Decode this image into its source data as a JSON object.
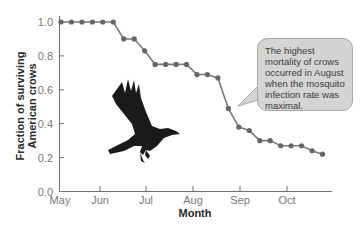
{
  "chart_data": {
    "type": "line",
    "title": "",
    "xlabel": "Month",
    "ylabel": "Fraction of surviving American crows",
    "ylabel_lines": [
      "Fraction of surviving",
      "American crows"
    ],
    "ylim": [
      0.0,
      1.0
    ],
    "yticks": [
      "0.0",
      "0.2",
      "0.4",
      "0.6",
      "0.8",
      "1.0"
    ],
    "xticks": [
      "May",
      "Jun",
      "Jul",
      "Aug",
      "Sep",
      "Oct"
    ],
    "grid": false,
    "legend": null,
    "series": [
      {
        "name": "Fraction of surviving American crows",
        "color": "#7a7a7a",
        "marker_color": "#666666",
        "points": [
          {
            "x": "May wk1",
            "y": 1.0
          },
          {
            "x": "May wk2",
            "y": 1.0
          },
          {
            "x": "May wk3",
            "y": 1.0
          },
          {
            "x": "May wk4",
            "y": 1.0
          },
          {
            "x": "Jun wk1",
            "y": 1.0
          },
          {
            "x": "Jun wk2",
            "y": 1.0
          },
          {
            "x": "Jun wk3",
            "y": 0.9
          },
          {
            "x": "Jun wk4",
            "y": 0.9
          },
          {
            "x": "Jul wk1",
            "y": 0.83
          },
          {
            "x": "Jul wk2",
            "y": 0.75
          },
          {
            "x": "Jul wk3",
            "y": 0.75
          },
          {
            "x": "Jul wk4",
            "y": 0.75
          },
          {
            "x": "Aug wk1",
            "y": 0.75
          },
          {
            "x": "Aug wk2",
            "y": 0.69
          },
          {
            "x": "Aug wk3",
            "y": 0.69
          },
          {
            "x": "Aug wk4",
            "y": 0.67
          },
          {
            "x": "Sep wk1",
            "y": 0.49
          },
          {
            "x": "Sep wk2",
            "y": 0.38
          },
          {
            "x": "Sep wk3",
            "y": 0.36
          },
          {
            "x": "Sep wk4",
            "y": 0.3
          },
          {
            "x": "Oct wk1",
            "y": 0.3
          },
          {
            "x": "Oct wk2",
            "y": 0.27
          },
          {
            "x": "Oct wk3",
            "y": 0.27
          },
          {
            "x": "Oct wk4",
            "y": 0.27
          },
          {
            "x": "Nov wk1",
            "y": 0.24
          },
          {
            "x": "Nov wk2",
            "y": 0.22
          }
        ]
      }
    ],
    "annotations": [
      {
        "text": "The highest mortality of crows occurred in August when the mosquito infection rate was maximal.",
        "points_to": "Sep wk1"
      }
    ],
    "image": "American crow in flight (decorative)"
  },
  "callout": {
    "lines": [
      "The highest",
      "mortality of crows",
      "occurred in August",
      "when the mosquito",
      "infection rate was",
      "maximal."
    ]
  },
  "colors": {
    "line": "#7a7a7a",
    "marker": "#666666",
    "axis": "#6e6e6e",
    "callout_fill": "#d4d4d4",
    "callout_border": "#a8a8a8",
    "crow": "#1a1a1a"
  }
}
